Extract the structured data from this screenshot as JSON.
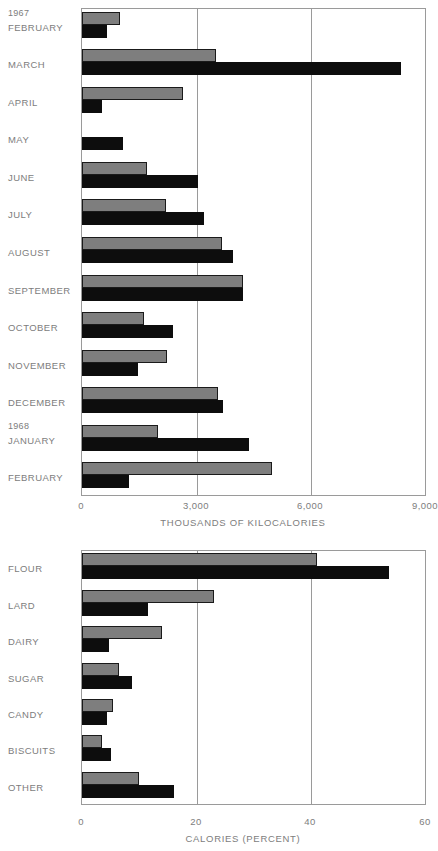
{
  "chart_data": [
    {
      "type": "bar",
      "orientation": "horizontal",
      "title": "",
      "xlabel": "THOUSANDS OF KILOCALORIES",
      "ylabel": "",
      "xlim": [
        0,
        9000
      ],
      "xticks": [
        0,
        3000,
        6000,
        9000
      ],
      "xticklabels": [
        "0",
        "3,000",
        "6,000",
        "9,000"
      ],
      "grid": true,
      "legend": false,
      "group_labels": [
        {
          "text": "1967",
          "before_category": "FEBRUARY"
        },
        {
          "text": "1968",
          "before_category": "JANUARY"
        }
      ],
      "categories": [
        "FEBRUARY",
        "MARCH",
        "APRIL",
        "MAY",
        "JUNE",
        "JULY",
        "AUGUST",
        "SEPTEMBER",
        "OCTOBER",
        "NOVEMBER",
        "DECEMBER",
        "JANUARY",
        "FEBRUARY"
      ],
      "series": [
        {
          "name": "gray",
          "color": "#7e7e7e",
          "values": [
            990,
            3500,
            2630,
            0,
            1700,
            2200,
            3650,
            4220,
            1620,
            2220,
            3570,
            1980,
            4960
          ]
        },
        {
          "name": "black",
          "color": "#0d0d0d",
          "values": [
            650,
            8350,
            520,
            1070,
            3030,
            3200,
            3940,
            4220,
            2370,
            1460,
            3680,
            4380,
            1230
          ]
        }
      ]
    },
    {
      "type": "bar",
      "orientation": "horizontal",
      "title": "",
      "xlabel": "CALORIES (PERCENT)",
      "ylabel": "",
      "xlim": [
        0,
        60
      ],
      "xticks": [
        0,
        20,
        40,
        60
      ],
      "xticklabels": [
        "0",
        "20",
        "40",
        "60"
      ],
      "grid": true,
      "legend": false,
      "categories": [
        "FLOUR",
        "LARD",
        "DAIRY",
        "SUGAR",
        "CANDY",
        "BISCUITS",
        "OTHER"
      ],
      "series": [
        {
          "name": "gray",
          "color": "#7e7e7e",
          "values": [
            41.0,
            23.0,
            14.0,
            6.4,
            5.4,
            3.5,
            10.0
          ]
        },
        {
          "name": "black",
          "color": "#0d0d0d",
          "values": [
            53.5,
            11.5,
            4.7,
            8.7,
            4.4,
            5.0,
            16.0
          ]
        }
      ]
    }
  ],
  "colors": {
    "gray_bar": "#7e7e7e",
    "black_bar": "#0d0d0d",
    "axis": "#9a9a9a",
    "text": "#7d7d7d",
    "background": "#ffffff"
  }
}
